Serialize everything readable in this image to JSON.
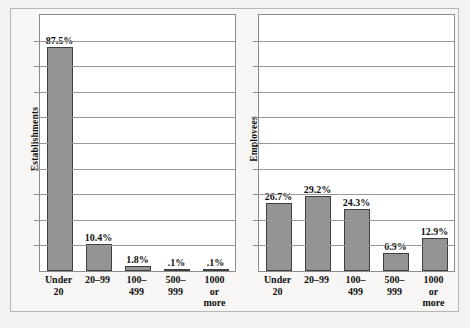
{
  "chart_data": [
    {
      "type": "bar",
      "title": "",
      "xlabel": "",
      "ylabel": "Establishments",
      "categories": [
        "Under 20",
        "20–99",
        "100–\n499",
        "500–\n999",
        "1000\nor\nmore"
      ],
      "category_lines": [
        [
          "Under 20"
        ],
        [
          "20–99"
        ],
        [
          "100–",
          "499"
        ],
        [
          "500–",
          "999"
        ],
        [
          "1000",
          "or",
          "more"
        ]
      ],
      "values": [
        87.5,
        10.4,
        1.8,
        0.1,
        0.1
      ],
      "value_labels": [
        "87.5%",
        "10.4%",
        "1.8%",
        ".1%",
        ".1%"
      ],
      "ylim": [
        0,
        100
      ],
      "gridline_step": 10,
      "grid": true,
      "legend": "none",
      "bar_color": "#949494",
      "bar_edge_color": "#3f3f3f"
    },
    {
      "type": "bar",
      "title": "",
      "xlabel": "",
      "ylabel": "Employees",
      "categories": [
        "Under 20",
        "20–99",
        "100–\n499",
        "500–\n999",
        "1000\nor\nmore"
      ],
      "category_lines": [
        [
          "Under 20"
        ],
        [
          "20–99"
        ],
        [
          "100–",
          "499"
        ],
        [
          "500–",
          "999"
        ],
        [
          "1000",
          "or",
          "more"
        ]
      ],
      "values": [
        26.7,
        29.2,
        24.3,
        6.9,
        12.9
      ],
      "value_labels": [
        "26.7%",
        "29.2%",
        "24.3%",
        "6.9%",
        "12.9%"
      ],
      "ylim": [
        0,
        100
      ],
      "gridline_step": 10,
      "grid": true,
      "legend": "none",
      "bar_color": "#949494",
      "bar_edge_color": "#3f3f3f"
    }
  ],
  "figure": {
    "background_color": "#f4f3f1",
    "frame_color": "#b9b7b4",
    "plot_background": "#ffffff",
    "gridline_color": "#9b9997"
  }
}
